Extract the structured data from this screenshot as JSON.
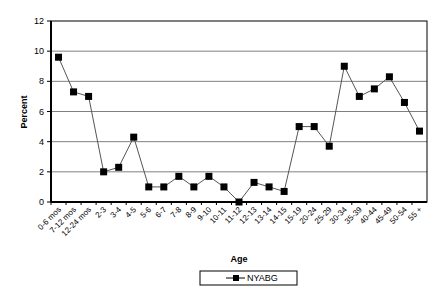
{
  "chart_data": {
    "type": "line",
    "title": "",
    "xlabel": "Age",
    "ylabel": "Percent",
    "ylim": [
      0,
      12
    ],
    "yticks": [
      0,
      2,
      4,
      6,
      8,
      10,
      12
    ],
    "grid": true,
    "legend_position": "bottom",
    "categories": [
      "0-6 mos",
      "7-12 mos",
      "12-24 mos",
      "2-3",
      "3-4",
      "4-5",
      "5-6",
      "6-7",
      "7-8",
      "8-9",
      "9-10",
      "10-11",
      "11-12",
      "12-13",
      "13-14",
      "14-15",
      "15-19",
      "20-24",
      "25-29",
      "30-34",
      "35-39",
      "40-44",
      "45-49",
      "50-54",
      "55 +"
    ],
    "series": [
      {
        "name": "NYABG",
        "marker": "square",
        "color": "#000000",
        "values": [
          9.6,
          7.3,
          7.0,
          2.0,
          2.3,
          4.3,
          1.0,
          1.0,
          1.7,
          1.0,
          1.7,
          1.0,
          0.0,
          1.3,
          1.0,
          0.7,
          5.0,
          5.0,
          3.7,
          9.0,
          7.0,
          7.5,
          8.3,
          6.6,
          4.7
        ]
      }
    ]
  },
  "axes": {
    "x_title": "Age",
    "y_title": "Percent"
  },
  "legend": {
    "label": "NYABG"
  }
}
